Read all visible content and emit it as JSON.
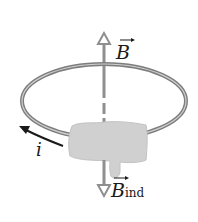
{
  "diagram": {
    "labels": {
      "applied_field": "B",
      "induced_field": "B",
      "induced_field_subscript": "ind",
      "current": "i"
    },
    "colors": {
      "ring": "#8a8a8a",
      "ring_highlight": "#c8c8c8",
      "axis": "#8f8f8f",
      "hand": "#cfcfcf",
      "current_arrow": "#1a1a1a",
      "text": "#1a1a1a"
    }
  }
}
